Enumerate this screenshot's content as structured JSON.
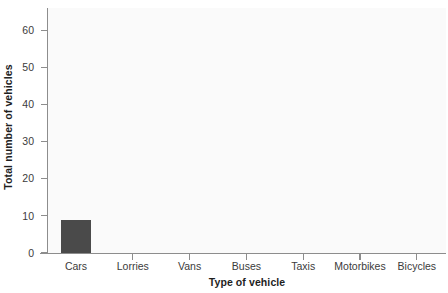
{
  "chart_data": {
    "type": "bar",
    "title": "",
    "xlabel": "Type of vehicle",
    "ylabel": "Total number of vehicles",
    "categories": [
      "Cars",
      "Lorries",
      "Vans",
      "Buses",
      "Taxis",
      "Motorbikes",
      "Bicycles"
    ],
    "values": [
      9,
      0,
      0,
      0,
      0,
      0,
      0
    ],
    "ylim": [
      0,
      66
    ],
    "yticks": [
      0,
      10,
      20,
      30,
      40,
      50,
      60
    ],
    "ytick_labels": [
      "0",
      "10",
      "20",
      "30",
      "40",
      "50",
      "60"
    ],
    "grid": false,
    "legend": null,
    "bar_color": "#4a4a4a",
    "axis_color": "#8d8d8d",
    "plot_background": "#fafafa",
    "text_color": "#3b3b3b"
  }
}
